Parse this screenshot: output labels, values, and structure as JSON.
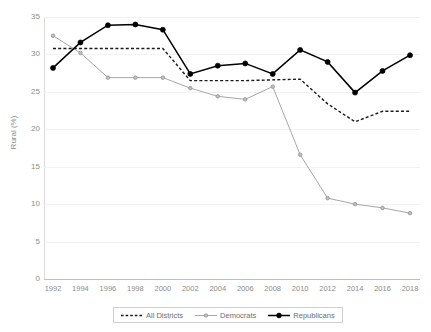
{
  "chart_data": {
    "type": "line",
    "title": "",
    "xlabel": "",
    "ylabel": "Rural (%)",
    "xlim": [
      1992,
      2018
    ],
    "ylim": [
      0,
      35
    ],
    "yticks": [
      0,
      5,
      10,
      15,
      20,
      25,
      30,
      35
    ],
    "grid": true,
    "legend_position": "bottom",
    "x": [
      1992,
      1994,
      1996,
      1998,
      2000,
      2002,
      2004,
      2006,
      2008,
      2010,
      2012,
      2014,
      2016,
      2018
    ],
    "categories": [
      "1992",
      "1994",
      "1996",
      "1998",
      "2000",
      "2002",
      "2004",
      "2006",
      "2008",
      "2010",
      "2012",
      "2014",
      "2016",
      "2018"
    ],
    "series": [
      {
        "name": "All Districts",
        "style": "dashed",
        "color": "#1a1a1a",
        "markers": false,
        "values": [
          30.8,
          30.8,
          30.8,
          30.8,
          30.8,
          26.5,
          26.5,
          26.5,
          26.6,
          26.7,
          23.4,
          21.0,
          22.4,
          22.4
        ]
      },
      {
        "name": "Democrats",
        "style": "solid",
        "color": "#a6a6a6",
        "markers": true,
        "values": [
          32.5,
          30.2,
          26.9,
          26.9,
          26.9,
          25.5,
          24.4,
          24.0,
          25.7,
          16.6,
          10.8,
          10.0,
          9.5,
          8.8
        ]
      },
      {
        "name": "Republicans",
        "style": "solid",
        "color": "#000000",
        "markers": true,
        "values": [
          28.2,
          31.6,
          33.9,
          34.0,
          33.3,
          27.4,
          28.5,
          28.8,
          27.4,
          30.6,
          29.0,
          24.9,
          27.8,
          29.9
        ]
      }
    ]
  },
  "legend": {
    "items": [
      {
        "label": "All Districts",
        "marker": "dashed-line"
      },
      {
        "label": "Democrats",
        "marker": "line-with-marker"
      },
      {
        "label": "Republicans",
        "marker": "line-with-marker"
      }
    ]
  },
  "colors": {
    "all_districts": "#1a1a1a",
    "democrats": "#a6a6a6",
    "republicans": "#000000",
    "gridline": "#f2f2f2",
    "axis": "#bfbfbf",
    "tick_text": "#8c8c8c"
  }
}
